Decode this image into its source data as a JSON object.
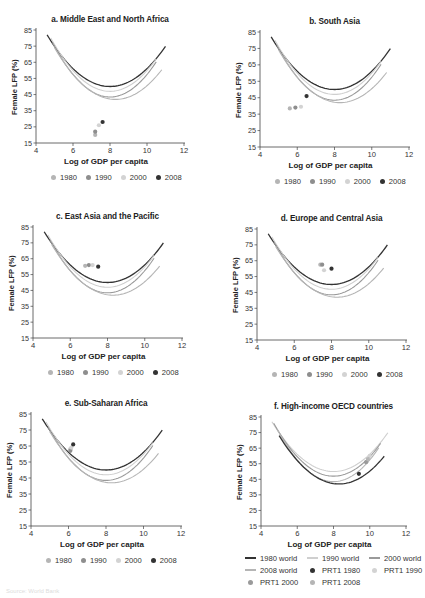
{
  "figure": {
    "source_note": "Source: World Bank"
  },
  "legend_years": {
    "items": [
      {
        "label": "1980",
        "color": "#b5b5b5"
      },
      {
        "label": "1990",
        "color": "#8e8e8e"
      },
      {
        "label": "2000",
        "color": "#d3d3d3"
      },
      {
        "label": "2008",
        "color": "#333333"
      }
    ]
  },
  "legend_f": {
    "rows": [
      [
        {
          "label": "1980 world",
          "kind": "line",
          "color": "#333333"
        },
        {
          "label": "1990 world",
          "kind": "line",
          "color": "#cfcfcf"
        },
        {
          "label": "2000 world",
          "kind": "line",
          "color": "#9a9a9a"
        }
      ],
      [
        {
          "label": "2008 world",
          "kind": "line",
          "color": "#b5b5b5"
        },
        {
          "label": "PRT1 1980",
          "kind": "dot",
          "color": "#333333"
        },
        {
          "label": "PRT1 1990",
          "kind": "dot",
          "color": "#d3d3d3"
        }
      ],
      [
        {
          "label": "PRT1 2000",
          "kind": "dot",
          "color": "#9a9a9a"
        },
        {
          "label": "PRT1 2008",
          "kind": "dot",
          "color": "#b5b5b5"
        }
      ]
    ]
  },
  "chart_data": [
    {
      "id": "a",
      "type": "scatter",
      "title": "a. Middle East and North Africa",
      "xlabel": "Log of GDP per capita",
      "ylabel": "Female LFP (%)",
      "xlim": [
        4,
        12
      ],
      "ylim": [
        15,
        85
      ],
      "xticks": [
        4,
        6,
        8,
        10,
        12
      ],
      "yticks": [
        15,
        25,
        35,
        45,
        55,
        65,
        75,
        85
      ],
      "grid": false,
      "legend_position": "bottom",
      "curves": [
        {
          "name": "2008 world",
          "x0": 4.6,
          "x1": 11.0,
          "vertex_x": 8.0,
          "vertex_y": 50,
          "y_at_x0": 82,
          "color": "#333333",
          "width": 1.3
        },
        {
          "name": "2000 world",
          "x0": 4.8,
          "x1": 10.5,
          "vertex_x": 8.0,
          "vertex_y": 47,
          "y_at_x0": 80,
          "color": "#cfcfcf",
          "width": 1.1
        },
        {
          "name": "1990 world",
          "x0": 4.9,
          "x1": 10.5,
          "vertex_x": 8.0,
          "vertex_y": 43.5,
          "y_at_x0": 77,
          "color": "#9a9a9a",
          "width": 1.1
        },
        {
          "name": "1980 world",
          "x0": 5.0,
          "x1": 10.8,
          "vertex_x": 8.3,
          "vertex_y": 42,
          "y_at_x0": 74,
          "color": "#b5b5b5",
          "width": 1.1
        }
      ],
      "series": [
        {
          "name": "1980",
          "color": "#b5b5b5",
          "points": [
            [
              7.2,
              20
            ]
          ]
        },
        {
          "name": "1990",
          "color": "#8e8e8e",
          "points": [
            [
              7.2,
              22
            ]
          ]
        },
        {
          "name": "2000",
          "color": "#d3d3d3",
          "points": [
            [
              7.4,
              26
            ]
          ]
        },
        {
          "name": "2008",
          "color": "#333333",
          "points": [
            [
              7.6,
              28
            ]
          ]
        }
      ],
      "frame": {
        "left": 10,
        "top": 12,
        "x4": 36,
        "x12": 184,
        "y85": 30,
        "y15": 143
      }
    },
    {
      "id": "b",
      "type": "scatter",
      "title": "b. South Asia",
      "xlabel": "Log of GDP per capita",
      "ylabel": "Female LFP (%)",
      "xlim": [
        4,
        12
      ],
      "ylim": [
        15,
        85
      ],
      "xticks": [
        4,
        6,
        8,
        10,
        12
      ],
      "yticks": [
        15,
        25,
        35,
        45,
        55,
        65,
        75,
        85
      ],
      "grid": false,
      "legend_position": "bottom",
      "curves": [
        {
          "name": "2008 world",
          "x0": 4.6,
          "x1": 11.0,
          "vertex_x": 8.0,
          "vertex_y": 50,
          "y_at_x0": 82,
          "color": "#333333",
          "width": 1.3
        },
        {
          "name": "2000 world",
          "x0": 4.8,
          "x1": 10.5,
          "vertex_x": 8.0,
          "vertex_y": 47,
          "y_at_x0": 80,
          "color": "#cfcfcf",
          "width": 1.1
        },
        {
          "name": "1990 world",
          "x0": 4.9,
          "x1": 10.5,
          "vertex_x": 8.0,
          "vertex_y": 43.5,
          "y_at_x0": 77,
          "color": "#9a9a9a",
          "width": 1.1
        },
        {
          "name": "1980 world",
          "x0": 5.0,
          "x1": 10.8,
          "vertex_x": 8.3,
          "vertex_y": 42,
          "y_at_x0": 74,
          "color": "#b5b5b5",
          "width": 1.1
        }
      ],
      "series": [
        {
          "name": "1980",
          "color": "#b5b5b5",
          "points": [
            [
              5.6,
              38.5
            ]
          ]
        },
        {
          "name": "1990",
          "color": "#8e8e8e",
          "points": [
            [
              5.9,
              39
            ]
          ]
        },
        {
          "name": "2000",
          "color": "#d3d3d3",
          "points": [
            [
              6.2,
              39.5
            ]
          ]
        },
        {
          "name": "2008",
          "color": "#333333",
          "points": [
            [
              6.5,
              46
            ]
          ]
        }
      ],
      "frame": {
        "left": 232,
        "top": 12,
        "x4": 260,
        "x12": 409,
        "y85": 32,
        "y15": 147
      }
    },
    {
      "id": "c",
      "type": "scatter",
      "title": "c. East Asia and the Pacific",
      "xlabel": "Log of GDP per capita",
      "ylabel": "Female LFP (%)",
      "xlim": [
        4,
        12
      ],
      "ylim": [
        15,
        85
      ],
      "xticks": [
        4,
        6,
        8,
        10,
        12
      ],
      "yticks": [
        15,
        25,
        35,
        45,
        55,
        65,
        75,
        85
      ],
      "grid": false,
      "legend_position": "bottom",
      "curves": [
        {
          "name": "2008 world",
          "x0": 4.6,
          "x1": 11.0,
          "vertex_x": 8.0,
          "vertex_y": 50,
          "y_at_x0": 82,
          "color": "#333333",
          "width": 1.3
        },
        {
          "name": "2000 world",
          "x0": 4.8,
          "x1": 10.5,
          "vertex_x": 8.0,
          "vertex_y": 47,
          "y_at_x0": 80,
          "color": "#cfcfcf",
          "width": 1.1
        },
        {
          "name": "1990 world",
          "x0": 4.9,
          "x1": 10.5,
          "vertex_x": 8.0,
          "vertex_y": 43.5,
          "y_at_x0": 77,
          "color": "#9a9a9a",
          "width": 1.1
        },
        {
          "name": "1980 world",
          "x0": 5.0,
          "x1": 10.8,
          "vertex_x": 8.3,
          "vertex_y": 42,
          "y_at_x0": 74,
          "color": "#b5b5b5",
          "width": 1.1
        }
      ],
      "series": [
        {
          "name": "1980",
          "color": "#b5b5b5",
          "points": [
            [
              6.8,
              60.5
            ]
          ]
        },
        {
          "name": "1990",
          "color": "#8e8e8e",
          "points": [
            [
              7.0,
              61
            ]
          ]
        },
        {
          "name": "2000",
          "color": "#d3d3d3",
          "points": [
            [
              7.2,
              61
            ]
          ]
        },
        {
          "name": "2008",
          "color": "#333333",
          "points": [
            [
              7.5,
              60
            ]
          ]
        }
      ],
      "frame": {
        "left": 10,
        "top": 207,
        "x4": 33,
        "x12": 182,
        "y85": 227,
        "y15": 338
      }
    },
    {
      "id": "d",
      "type": "scatter",
      "title": "d. Europe and Central Asia",
      "xlabel": "Log of GDP per capita",
      "ylabel": "Female LFP (%)",
      "xlim": [
        4,
        12
      ],
      "ylim": [
        15,
        85
      ],
      "xticks": [
        4,
        6,
        8,
        10,
        12
      ],
      "yticks": [
        15,
        25,
        35,
        45,
        55,
        65,
        75,
        85
      ],
      "grid": false,
      "legend_position": "bottom",
      "curves": [
        {
          "name": "2008 world",
          "x0": 4.6,
          "x1": 11.0,
          "vertex_x": 8.0,
          "vertex_y": 50,
          "y_at_x0": 82,
          "color": "#333333",
          "width": 1.3
        },
        {
          "name": "2000 world",
          "x0": 4.8,
          "x1": 10.5,
          "vertex_x": 8.0,
          "vertex_y": 47,
          "y_at_x0": 80,
          "color": "#cfcfcf",
          "width": 1.1
        },
        {
          "name": "1990 world",
          "x0": 4.9,
          "x1": 10.5,
          "vertex_x": 8.0,
          "vertex_y": 43.5,
          "y_at_x0": 77,
          "color": "#9a9a9a",
          "width": 1.1
        },
        {
          "name": "1980 world",
          "x0": 5.0,
          "x1": 10.8,
          "vertex_x": 8.3,
          "vertex_y": 42,
          "y_at_x0": 74,
          "color": "#b5b5b5",
          "width": 1.1
        }
      ],
      "series": [
        {
          "name": "1980",
          "color": "#b5b5b5",
          "points": [
            [
              7.4,
              62.5
            ]
          ]
        },
        {
          "name": "1990",
          "color": "#8e8e8e",
          "points": [
            [
              7.5,
              62.5
            ]
          ]
        },
        {
          "name": "2000",
          "color": "#d3d3d3",
          "points": [
            [
              7.6,
              59
            ]
          ]
        },
        {
          "name": "2008",
          "color": "#333333",
          "points": [
            [
              8.0,
              60
            ]
          ]
        }
      ],
      "frame": {
        "left": 232,
        "top": 207,
        "x4": 257,
        "x12": 406,
        "y85": 229,
        "y15": 340
      }
    },
    {
      "id": "e",
      "type": "scatter",
      "title": "e. Sub-Saharan Africa",
      "xlabel": "Log of GDP per capita",
      "ylabel": "Female LFP (%)",
      "xlim": [
        4,
        12
      ],
      "ylim": [
        15,
        85
      ],
      "xticks": [
        4,
        6,
        8,
        10,
        12
      ],
      "yticks": [
        15,
        25,
        35,
        45,
        55,
        65,
        75,
        85
      ],
      "grid": false,
      "legend_position": "bottom",
      "curves": [
        {
          "name": "2008 world",
          "x0": 4.6,
          "x1": 11.0,
          "vertex_x": 8.0,
          "vertex_y": 50,
          "y_at_x0": 82,
          "color": "#333333",
          "width": 1.3
        },
        {
          "name": "2000 world",
          "x0": 4.8,
          "x1": 10.5,
          "vertex_x": 8.0,
          "vertex_y": 47,
          "y_at_x0": 80,
          "color": "#cfcfcf",
          "width": 1.1
        },
        {
          "name": "1990 world",
          "x0": 4.9,
          "x1": 10.5,
          "vertex_x": 8.0,
          "vertex_y": 43.5,
          "y_at_x0": 77,
          "color": "#9a9a9a",
          "width": 1.1
        },
        {
          "name": "1980 world",
          "x0": 5.0,
          "x1": 10.8,
          "vertex_x": 8.3,
          "vertex_y": 42,
          "y_at_x0": 74,
          "color": "#b5b5b5",
          "width": 1.1
        }
      ],
      "series": [
        {
          "name": "1980",
          "color": "#b5b5b5",
          "points": [
            [
              6.1,
              63
            ]
          ]
        },
        {
          "name": "1990",
          "color": "#8e8e8e",
          "points": [
            [
              6.1,
              62
            ]
          ]
        },
        {
          "name": "2000",
          "color": "#d3d3d3",
          "points": [
            [
              6.15,
              64
            ]
          ]
        },
        {
          "name": "2008",
          "color": "#333333",
          "points": [
            [
              6.25,
              66
            ]
          ]
        }
      ],
      "frame": {
        "left": 10,
        "top": 396,
        "x4": 31,
        "x12": 181,
        "y85": 414,
        "y15": 526
      }
    },
    {
      "id": "f",
      "type": "scatter",
      "title": "f. High-income OECD countries",
      "xlabel": "Log of GDP per capita",
      "ylabel": "Female LFP (%)",
      "xlim": [
        4,
        12
      ],
      "ylim": [
        15,
        85
      ],
      "xticks": [
        4,
        6,
        8,
        10,
        12
      ],
      "yticks": [
        15,
        25,
        35,
        45,
        55,
        65,
        75,
        85
      ],
      "grid": false,
      "legend_position": "bottom",
      "curves": [
        {
          "name": "1990 world",
          "x0": 4.6,
          "x1": 11.0,
          "vertex_x": 8.0,
          "vertex_y": 50,
          "y_at_x0": 82,
          "color": "#cfcfcf",
          "width": 1.1
        },
        {
          "name": "2000 world",
          "x0": 4.7,
          "x1": 10.6,
          "vertex_x": 8.0,
          "vertex_y": 47,
          "y_at_x0": 81,
          "color": "#9a9a9a",
          "width": 1.1
        },
        {
          "name": "2008 world",
          "x0": 4.9,
          "x1": 10.5,
          "vertex_x": 8.0,
          "vertex_y": 43.5,
          "y_at_x0": 77,
          "color": "#b5b5b5",
          "width": 1.1
        },
        {
          "name": "1980 world",
          "x0": 5.0,
          "x1": 10.8,
          "vertex_x": 8.3,
          "vertex_y": 42,
          "y_at_x0": 73,
          "color": "#333333",
          "width": 1.3
        }
      ],
      "series": [
        {
          "name": "PRT1 1980",
          "color": "#333333",
          "points": [
            [
              9.4,
              48.5
            ]
          ]
        },
        {
          "name": "PRT1 1990",
          "color": "#d3d3d3",
          "points": [
            [
              10.0,
              60
            ]
          ]
        },
        {
          "name": "PRT1 2000",
          "color": "#9a9a9a",
          "points": [
            [
              9.8,
              56
            ]
          ]
        },
        {
          "name": "PRT1 2008",
          "color": "#b5b5b5",
          "points": [
            [
              9.9,
              58
            ]
          ]
        }
      ],
      "frame": {
        "left": 232,
        "top": 396,
        "x4": 261,
        "x12": 406,
        "y85": 417,
        "y15": 526
      }
    }
  ]
}
